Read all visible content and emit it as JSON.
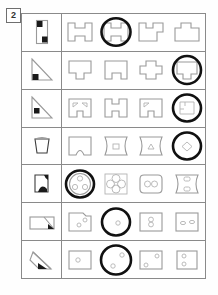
{
  "worksheet": {
    "problem_number": "2",
    "columns": 5,
    "rows": 7,
    "prompt_column_label": "prompt-figure",
    "option_count_per_row": 4
  },
  "rows": [
    {
      "id": "row-1",
      "prompt": {
        "name": "vertical-rectangle-two-black-squares",
        "shape": "rectangle-tall"
      },
      "options": [
        {
          "name": "h-shape-notched-both-sides",
          "selected": false
        },
        {
          "name": "h-shape-notched-both-sides",
          "selected": true
        },
        {
          "name": "notched-block-right-tab",
          "selected": false
        },
        {
          "name": "notched-block-center-tab",
          "selected": false
        }
      ],
      "answer_index": 2
    },
    {
      "id": "row-2",
      "prompt": {
        "name": "right-triangle-black-square-bottom-left",
        "shape": "triangle"
      },
      "options": [
        {
          "name": "square-bottom-tab",
          "selected": false
        },
        {
          "name": "square-bottom-tab-corner-cut",
          "selected": false
        },
        {
          "name": "cross-plus-block",
          "selected": false
        },
        {
          "name": "square-bottom-tab",
          "selected": true
        }
      ],
      "answer_index": 4
    },
    {
      "id": "row-3",
      "prompt": {
        "name": "right-triangle-black-square-bottom-left",
        "shape": "triangle"
      },
      "options": [
        {
          "name": "square-two-triangle-holes-bottom-notch",
          "selected": false
        },
        {
          "name": "h-block-double-notch",
          "selected": false
        },
        {
          "name": "square-one-triangle-hole-bottom-notch",
          "selected": false
        },
        {
          "name": "square-corner-marks",
          "selected": true
        }
      ],
      "answer_index": 4
    },
    {
      "id": "row-4",
      "prompt": {
        "name": "bucket-trapezoid-shape",
        "shape": "trapezoid"
      },
      "options": [
        {
          "name": "square-bottom-arch-cut",
          "selected": false
        },
        {
          "name": "hourglass-block-square-hole",
          "selected": false
        },
        {
          "name": "hourglass-block-triangle-hole",
          "selected": false
        },
        {
          "name": "diamond-hole-shape",
          "selected": true
        }
      ],
      "answer_index": 4
    },
    {
      "id": "row-5",
      "prompt": {
        "name": "square-black-arc-corner",
        "shape": "square-with-arc"
      },
      "options": [
        {
          "name": "disc-three-holes",
          "selected": true
        },
        {
          "name": "four-lobe-clover-block",
          "selected": false
        },
        {
          "name": "rounded-block-two-holes",
          "selected": false
        },
        {
          "name": "hourglass-block-two-slots",
          "selected": false
        }
      ],
      "answer_index": 1
    },
    {
      "id": "row-6",
      "prompt": {
        "name": "rectangle-diagonal-black-wedge",
        "shape": "rectangle-wedge"
      },
      "options": [
        {
          "name": "square-corner-notch-two-holes",
          "selected": false
        },
        {
          "name": "square-single-hole",
          "selected": true
        },
        {
          "name": "square-two-stacked-holes",
          "selected": false
        },
        {
          "name": "square-two-small-holes",
          "selected": false
        }
      ],
      "answer_index": 2
    },
    {
      "id": "row-7",
      "prompt": {
        "name": "parallelogram-black-wedge-diagonal",
        "shape": "parallelogram-wedge"
      },
      "options": [
        {
          "name": "square-single-hole",
          "selected": false
        },
        {
          "name": "square-two-holes-diagonal",
          "selected": true
        },
        {
          "name": "square-hole-corner",
          "selected": false
        },
        {
          "name": "square-two-holes-vertical",
          "selected": false
        }
      ],
      "answer_index": 2
    }
  ],
  "colors": {
    "grid_line": "#8a8a8a",
    "shape_outline": "#9a9a9a",
    "ink_black": "#1a1a1a",
    "selection_ring": "#111111",
    "page_background": "#ffffff"
  }
}
